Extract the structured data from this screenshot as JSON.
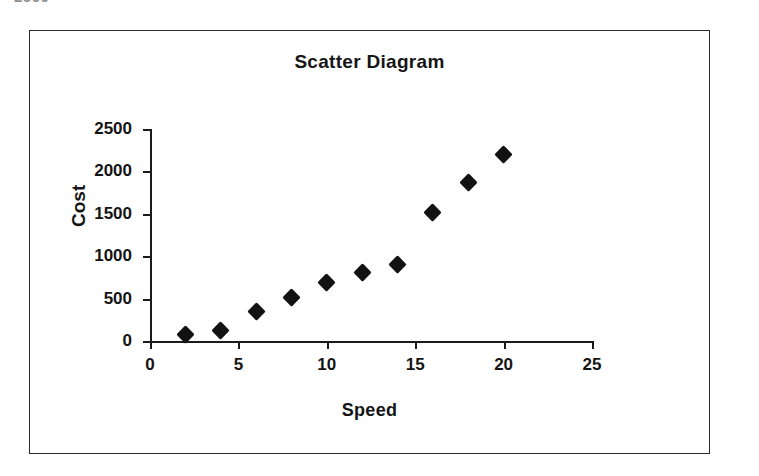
{
  "page": {
    "top_fragment_text": "2500"
  },
  "chart_data": {
    "type": "scatter",
    "title": "Scatter Diagram",
    "xlabel": "Speed",
    "ylabel": "Cost",
    "xlim": [
      0,
      25
    ],
    "ylim": [
      0,
      2500
    ],
    "xticks": [
      "0",
      "5",
      "10",
      "15",
      "20",
      "25"
    ],
    "xtick_values": [
      0,
      5,
      10,
      15,
      20,
      25
    ],
    "yticks": [
      "0",
      "500",
      "1000",
      "1500",
      "2000",
      "2500"
    ],
    "ytick_values": [
      0,
      500,
      1000,
      1500,
      2000,
      2500
    ],
    "grid": false,
    "legend": false,
    "marker": "diamond",
    "marker_color": "#121212",
    "x": [
      2,
      4,
      6,
      8,
      10,
      12,
      14,
      16,
      18,
      20
    ],
    "values": [
      75,
      120,
      350,
      510,
      690,
      810,
      900,
      1510,
      1875,
      2200
    ],
    "points": [
      {
        "x": 2,
        "y": 75
      },
      {
        "x": 4,
        "y": 120
      },
      {
        "x": 6,
        "y": 350
      },
      {
        "x": 8,
        "y": 510
      },
      {
        "x": 10,
        "y": 690
      },
      {
        "x": 12,
        "y": 810
      },
      {
        "x": 14,
        "y": 900
      },
      {
        "x": 16,
        "y": 1510
      },
      {
        "x": 18,
        "y": 1875
      },
      {
        "x": 20,
        "y": 2200
      }
    ]
  }
}
